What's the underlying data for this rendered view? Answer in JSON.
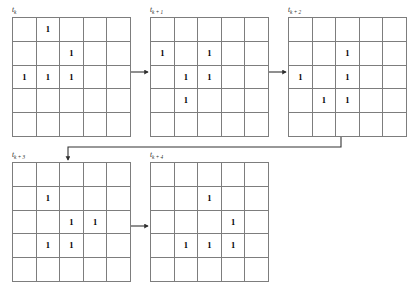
{
  "diagram": {
    "grid_rows": 5,
    "grid_cols": 5,
    "alive_symbol": "1",
    "dead_symbol": "",
    "line_color": "#7d7d7d",
    "arrow_color": "#333333",
    "background": "#ffffff",
    "frames": [
      {
        "id": "frame-tk",
        "label_base": "t",
        "label_sub": "k",
        "label_text": "tk",
        "x": 12,
        "y": 17,
        "cells": [
          [
            "",
            "1",
            "",
            "",
            ""
          ],
          [
            "",
            "",
            "1",
            "",
            ""
          ],
          [
            "1",
            "1",
            "1",
            "",
            ""
          ],
          [
            "",
            "",
            "",
            "",
            ""
          ],
          [
            "",
            "",
            "",
            "",
            ""
          ]
        ]
      },
      {
        "id": "frame-tk1",
        "label_base": "t",
        "label_sub": "k + 1",
        "label_text": "tk + 1",
        "x": 150,
        "y": 17,
        "cells": [
          [
            "",
            "",
            "",
            "",
            ""
          ],
          [
            "1",
            "",
            "1",
            "",
            ""
          ],
          [
            "",
            "1",
            "1",
            "",
            ""
          ],
          [
            "",
            "1",
            "",
            "",
            ""
          ],
          [
            "",
            "",
            "",
            "",
            ""
          ]
        ]
      },
      {
        "id": "frame-tk2",
        "label_base": "t",
        "label_sub": "k + 2",
        "label_text": "tk + 2",
        "x": 288,
        "y": 17,
        "cells": [
          [
            "",
            "",
            "",
            "",
            ""
          ],
          [
            "",
            "",
            "1",
            "",
            ""
          ],
          [
            "1",
            "",
            "1",
            "",
            ""
          ],
          [
            "",
            "1",
            "1",
            "",
            ""
          ],
          [
            "",
            "",
            "",
            "",
            ""
          ]
        ]
      },
      {
        "id": "frame-tk3",
        "label_base": "t",
        "label_sub": "k + 3",
        "label_text": "tk + 3",
        "x": 12,
        "y": 162,
        "cells": [
          [
            "",
            "",
            "",
            "",
            ""
          ],
          [
            "",
            "1",
            "",
            "",
            ""
          ],
          [
            "",
            "",
            "1",
            "1",
            ""
          ],
          [
            "",
            "1",
            "1",
            "",
            ""
          ],
          [
            "",
            "",
            "",
            "",
            ""
          ]
        ]
      },
      {
        "id": "frame-tk4",
        "label_base": "t",
        "label_sub": "k + 4",
        "label_text": "tk + 4",
        "x": 150,
        "y": 162,
        "cells": [
          [
            "",
            "",
            "",
            "",
            ""
          ],
          [
            "",
            "",
            "1",
            "",
            ""
          ],
          [
            "",
            "",
            "",
            "1",
            ""
          ],
          [
            "",
            "1",
            "1",
            "1",
            ""
          ],
          [
            "",
            "",
            "",
            "",
            ""
          ]
        ]
      }
    ],
    "arrows": [
      {
        "name": "arrow-tk-to-tk1",
        "from_frame": "frame-tk",
        "to_frame": "frame-tk1",
        "kind": "horizontal",
        "path": "M 127 72 L 148 72"
      },
      {
        "name": "arrow-tk1-to-tk2",
        "from_frame": "frame-tk1",
        "to_frame": "frame-tk2",
        "kind": "horizontal",
        "path": "M 265 72 L 286 72"
      },
      {
        "name": "arrow-tk2-to-tk3",
        "from_frame": "frame-tk2",
        "to_frame": "frame-tk3",
        "kind": "wrap-down-left",
        "path": "M 341 132 L 341 147 L 68 147 L 68 160"
      },
      {
        "name": "arrow-tk3-to-tk4",
        "from_frame": "frame-tk3",
        "to_frame": "frame-tk4",
        "kind": "horizontal",
        "path": "M 127 226 L 148 226"
      }
    ]
  }
}
